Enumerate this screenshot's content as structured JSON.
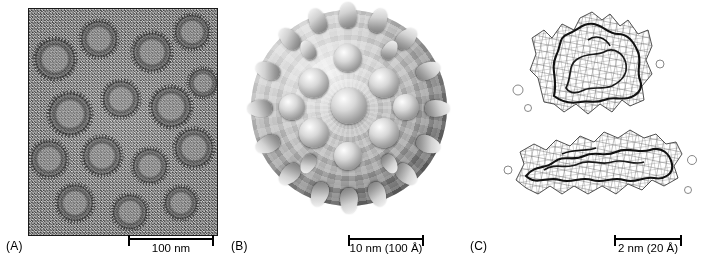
{
  "figure": {
    "panels": [
      {
        "id": "A",
        "label": "(A)",
        "image_kind": "cryo-electron-micrograph-of-virus-particles",
        "scalebar": {
          "text": "100 nm",
          "width_px": 86
        }
      },
      {
        "id": "B",
        "label": "(B)",
        "image_kind": "three-dimensional-reconstruction-of-virus-capsid",
        "scalebar": {
          "text": "10 nm (100 Å)",
          "width_px": 76
        }
      },
      {
        "id": "C",
        "label": "(C)",
        "image_kind": "density-map-mesh-with-fitted-atomic-model",
        "scalebar": {
          "text": "2 nm (20 Å)",
          "width_px": 68
        }
      }
    ]
  },
  "colors": {
    "background": "#ffffff",
    "ink": "#000000",
    "micrograph_base": "#8e8e8e",
    "capsid_light": "#f2f2f2",
    "capsid_dark": "#6f6f6f"
  }
}
